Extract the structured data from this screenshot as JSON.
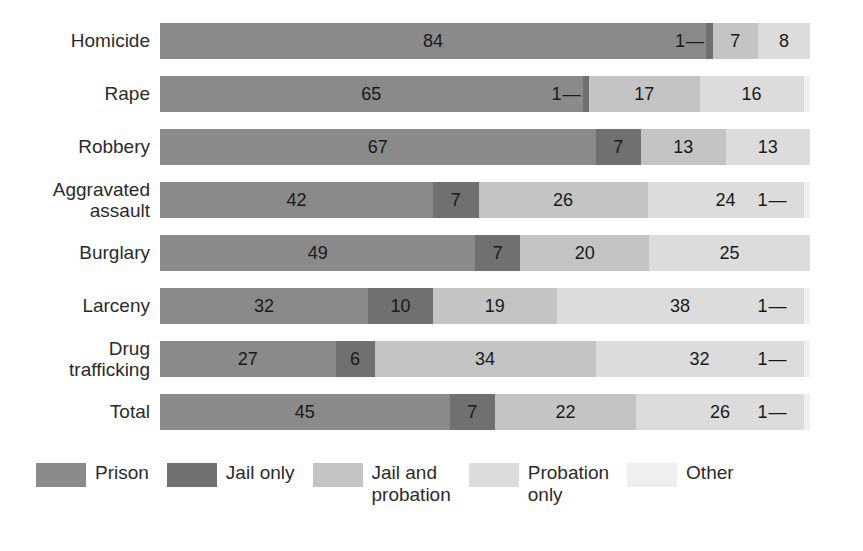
{
  "chart_data": {
    "type": "bar",
    "subtype": "horizontal-stacked-percent",
    "title": "",
    "subtitle": "",
    "xlabel": "",
    "ylabel": "",
    "xlim": [
      0,
      100
    ],
    "grid": false,
    "legend_position": "bottom",
    "categories": [
      "Homicide",
      "Rape",
      "Robbery",
      "Aggravated\nassault",
      "Burglary",
      "Larceny",
      "Drug\ntrafficking",
      "Total"
    ],
    "series": [
      {
        "name": "Prison",
        "color": "#8a8a8a",
        "values": [
          84,
          65,
          67,
          42,
          49,
          32,
          27,
          45
        ]
      },
      {
        "name": "Jail only",
        "color": "#707070",
        "values": [
          1,
          1,
          7,
          7,
          7,
          10,
          6,
          7
        ]
      },
      {
        "name": "Jail and probation",
        "color": "#c4c4c4",
        "values": [
          7,
          17,
          13,
          26,
          20,
          19,
          34,
          22
        ]
      },
      {
        "name": "Probation only",
        "color": "#dcdcdc",
        "values": [
          8,
          16,
          13,
          24,
          25,
          38,
          32,
          26
        ]
      },
      {
        "name": "Other",
        "color": "#efefef",
        "values": [
          0,
          1,
          0,
          1,
          0,
          1,
          1,
          1
        ]
      }
    ],
    "bar_labels": [
      [
        "84",
        "1",
        "7",
        "8",
        ""
      ],
      [
        "65",
        "1",
        "17",
        "16",
        ""
      ],
      [
        "67",
        "7",
        "13",
        "13",
        ""
      ],
      [
        "42",
        "7",
        "26",
        "24",
        "1"
      ],
      [
        "49",
        "7",
        "20",
        "25",
        ""
      ],
      [
        "32",
        "10",
        "19",
        "38",
        "1"
      ],
      [
        "27",
        "6",
        "34",
        "32",
        "1"
      ],
      [
        "45",
        "7",
        "22",
        "26",
        "1"
      ]
    ]
  },
  "legend": {
    "items": [
      {
        "label": "Prison",
        "color": "#8a8a8a"
      },
      {
        "label": "Jail only",
        "color": "#707070"
      },
      {
        "label": "Jail and\nprobation",
        "color": "#c4c4c4"
      },
      {
        "label": "Probation\nonly",
        "color": "#dcdcdc"
      },
      {
        "label": "Other",
        "color": "#efefef"
      }
    ]
  }
}
